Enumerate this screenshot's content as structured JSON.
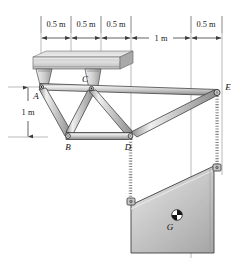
{
  "figure": {
    "type": "statics-truss-free-body-diagram",
    "dimensions": {
      "horizontal": [
        {
          "id": "d1",
          "label": "0.5 m",
          "value": 0.5,
          "unit": "m",
          "from": "A",
          "to": "B-top"
        },
        {
          "id": "d2",
          "label": "0.5 m",
          "value": 0.5,
          "unit": "m",
          "from": "B-top",
          "to": "C"
        },
        {
          "id": "d3",
          "label": "0.5 m",
          "value": 0.5,
          "unit": "m",
          "from": "C",
          "to": "D-top"
        },
        {
          "id": "d4",
          "label": "1 m",
          "value": 1,
          "unit": "m",
          "from": "D-top",
          "to": "chain-left"
        },
        {
          "id": "d5",
          "label": "0.5 m",
          "value": 0.5,
          "unit": "m",
          "from": "chain-left",
          "to": "E"
        }
      ],
      "vertical": [
        {
          "id": "v1",
          "label": "1 m",
          "value": 1,
          "unit": "m",
          "from": "A",
          "to": "B"
        }
      ]
    },
    "joint_labels": [
      {
        "id": "A",
        "label": "A"
      },
      {
        "id": "B",
        "label": "B"
      },
      {
        "id": "C",
        "label": "C"
      },
      {
        "id": "D",
        "label": "D"
      },
      {
        "id": "E",
        "label": "E"
      },
      {
        "id": "G",
        "label": "G"
      }
    ],
    "colors": {
      "member_fill": "#b9b9b9",
      "member_light": "#e4e4e4",
      "member_dark": "#8e8e8e",
      "outline": "#2b2b2b",
      "ceiling_fill": "#d2d2d2",
      "plate_fill": "#c2c2c2",
      "plate_light": "#e8e8e8",
      "chain": "#9a9a9a",
      "dimension_line": "#4a4a4a",
      "text": "#111111",
      "background": "#ffffff"
    }
  }
}
